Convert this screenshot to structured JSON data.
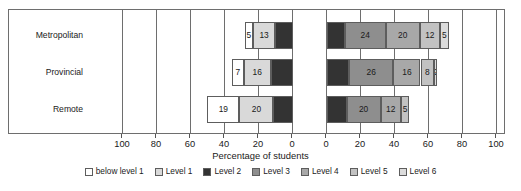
{
  "chart_data": {
    "type": "bar",
    "subtype": "diverging-stacked-bar-100",
    "title": "",
    "xlabel": "Percentage of students",
    "ylabel": "",
    "categories": [
      "Metropolitan",
      "Provincial",
      "Remote"
    ],
    "series": [
      {
        "name": "below level 1",
        "color": "#ffffff",
        "values": [
          5,
          7,
          19
        ]
      },
      {
        "name": "Level 1",
        "color": "#d9d9d9",
        "values": [
          13,
          16,
          20
        ]
      },
      {
        "name": "Level 2",
        "color": "#333333",
        "values": [
          21,
          26,
          23
        ]
      },
      {
        "name": "Level 3",
        "color": "#8e8e8e",
        "values": [
          24,
          26,
          20
        ]
      },
      {
        "name": "Level 4",
        "color": "#a8a8a8",
        "values": [
          20,
          16,
          12
        ]
      },
      {
        "name": "Level 5",
        "color": "#c2c2c2",
        "values": [
          12,
          8,
          5
        ]
      },
      {
        "name": "Level 6",
        "color": "#dcdcdc",
        "values": [
          5,
          2,
          0
        ]
      }
    ],
    "axis": {
      "tick_labels": [
        "100",
        "80",
        "60",
        "40",
        "20",
        "0",
        "0",
        "20",
        "40",
        "60",
        "80",
        "100"
      ],
      "tick_values": [
        -100,
        -80,
        -60,
        -40,
        -20,
        0,
        0,
        20,
        40,
        60,
        80,
        100
      ],
      "xlim": [
        -100,
        100
      ],
      "grid": true,
      "diverging_center_label_count": 2
    },
    "legend": {
      "position": "bottom",
      "entries": [
        "below level 1",
        "Level 1",
        "Level 2",
        "Level 3",
        "Level 4",
        "Level 5",
        "Level 6"
      ]
    },
    "bar_labels": {
      "Metropolitan": [
        5,
        13,
        21,
        24,
        20,
        12,
        5
      ],
      "Provincial": [
        7,
        16,
        26,
        26,
        16,
        8,
        2
      ],
      "Remote": [
        19,
        20,
        23,
        20,
        12,
        5
      ]
    }
  }
}
